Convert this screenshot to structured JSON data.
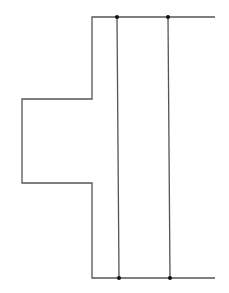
{
  "diagram": {
    "background": "#ffffff",
    "stroke_color": "#555555",
    "node_color": "#111111",
    "outline_path": [
      [
        215,
        17
      ],
      [
        92,
        17
      ],
      [
        92,
        99
      ],
      [
        22,
        99
      ],
      [
        22,
        183
      ],
      [
        92,
        183
      ],
      [
        92,
        278
      ],
      [
        215,
        278
      ]
    ],
    "vertical_lines": [
      {
        "x_top": 117,
        "y_top": 17,
        "x_bottom": 119,
        "y_bottom": 278
      },
      {
        "x_top": 168,
        "y_top": 17,
        "x_bottom": 170,
        "y_bottom": 278
      }
    ],
    "nodes": [
      {
        "x": 117,
        "y": 17
      },
      {
        "x": 168,
        "y": 17
      },
      {
        "x": 119,
        "y": 278
      },
      {
        "x": 170,
        "y": 278
      }
    ]
  }
}
